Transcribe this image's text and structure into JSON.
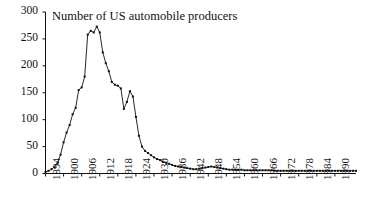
{
  "chart_data": {
    "type": "line",
    "title": "Number of US automobile producers",
    "xlabel": "",
    "ylabel": "",
    "grid": false,
    "legend": null,
    "markers": "filled-square",
    "line_color": "#111111",
    "marker_color": "#111111",
    "background": "#ffffff",
    "xlim": [
      1894,
      1997
    ],
    "ylim": [
      0,
      300
    ],
    "ytick_values": [
      0,
      50,
      100,
      150,
      200,
      250,
      300
    ],
    "ytick_labels": [
      "0",
      "50",
      "100",
      "150",
      "200",
      "250",
      "300"
    ],
    "xtick_values": [
      1894,
      1900,
      1906,
      1912,
      1918,
      1924,
      1930,
      1936,
      1942,
      1948,
      1954,
      1960,
      1966,
      1972,
      1978,
      1984,
      1990
    ],
    "xtick_labels": [
      "1894",
      "1900",
      "1906",
      "1912",
      "1918",
      "1924",
      "1930",
      "1936",
      "1942",
      "1948",
      "1954",
      "1960",
      "1966",
      "1972",
      "1978",
      "1984",
      "1990"
    ],
    "x": [
      1894,
      1895,
      1896,
      1897,
      1898,
      1899,
      1900,
      1901,
      1902,
      1903,
      1904,
      1905,
      1906,
      1907,
      1908,
      1909,
      1910,
      1911,
      1912,
      1913,
      1914,
      1915,
      1916,
      1917,
      1918,
      1919,
      1920,
      1921,
      1922,
      1923,
      1924,
      1925,
      1926,
      1927,
      1928,
      1929,
      1930,
      1931,
      1932,
      1933,
      1934,
      1935,
      1936,
      1937,
      1938,
      1939,
      1940,
      1941,
      1942,
      1943,
      1944,
      1945,
      1946,
      1947,
      1948,
      1949,
      1950,
      1951,
      1952,
      1953,
      1954,
      1955,
      1956,
      1957,
      1958,
      1959,
      1960,
      1961,
      1962,
      1963,
      1964,
      1965,
      1966,
      1967,
      1968,
      1969,
      1970,
      1971,
      1972,
      1973,
      1974,
      1975,
      1976,
      1977,
      1978,
      1979,
      1980,
      1981,
      1982,
      1983,
      1984,
      1985,
      1986,
      1987,
      1988,
      1989,
      1990,
      1991,
      1992,
      1993,
      1994,
      1995,
      1996,
      1997
    ],
    "y": [
      3,
      5,
      8,
      12,
      20,
      35,
      58,
      76,
      90,
      110,
      122,
      155,
      160,
      180,
      258,
      265,
      262,
      273,
      262,
      225,
      205,
      190,
      170,
      165,
      163,
      158,
      120,
      133,
      153,
      143,
      105,
      70,
      50,
      42,
      38,
      34,
      30,
      27,
      25,
      22,
      20,
      18,
      16,
      14,
      13,
      12,
      11,
      10,
      9,
      8,
      8,
      9,
      10,
      11,
      12,
      13,
      12,
      11,
      10,
      9,
      8,
      7,
      7,
      7,
      7,
      7,
      6,
      6,
      6,
      6,
      6,
      6,
      6,
      6,
      6,
      6,
      5,
      5,
      5,
      5,
      5,
      5,
      5,
      5,
      5,
      5,
      5,
      5,
      5,
      5,
      5,
      5,
      5,
      5,
      5,
      5,
      5,
      5,
      5,
      5,
      5,
      5,
      5,
      5
    ],
    "series_name": "US automobile producers"
  },
  "axes": {
    "y_axis_name": "y-axis-line",
    "x_axis_name": "x-axis-line"
  }
}
